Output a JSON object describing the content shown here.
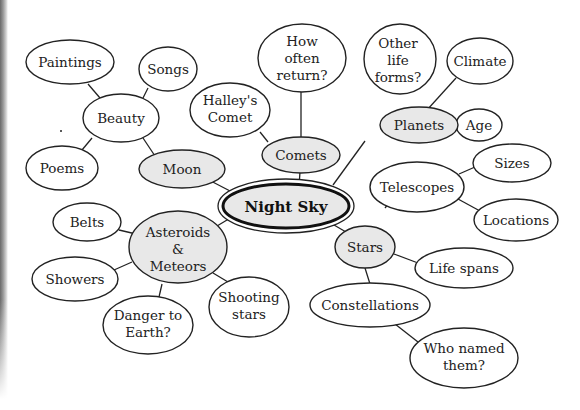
{
  "diagram": {
    "type": "concept-map",
    "colors": {
      "stroke": "#222222",
      "primary_fill": "#e8e8e8",
      "leaf_fill": "#ffffff",
      "background": "#ffffff"
    },
    "center": {
      "id": "night-sky",
      "label": "Night Sky"
    },
    "nodes": [
      {
        "id": "moon",
        "label": "Moon",
        "level": "primary",
        "parent": "night-sky"
      },
      {
        "id": "comets",
        "label": "Comets",
        "level": "primary",
        "parent": "night-sky"
      },
      {
        "id": "planets",
        "label": "Planets",
        "level": "primary",
        "parent": "night-sky"
      },
      {
        "id": "stars",
        "label": "Stars",
        "level": "primary",
        "parent": "night-sky"
      },
      {
        "id": "asteroids",
        "label": "Asteroids & Meteors",
        "lines": [
          "Asteroids",
          "&",
          "Meteors"
        ],
        "level": "primary",
        "parent": "night-sky"
      },
      {
        "id": "beauty",
        "label": "Beauty",
        "level": "secondary",
        "parent": "moon"
      },
      {
        "id": "paintings",
        "label": "Paintings",
        "level": "leaf",
        "parent": "beauty"
      },
      {
        "id": "songs",
        "label": "Songs",
        "level": "leaf",
        "parent": "beauty"
      },
      {
        "id": "poems",
        "label": "Poems",
        "level": "leaf",
        "parent": "beauty"
      },
      {
        "id": "halleys",
        "label": "Halley's Comet",
        "lines": [
          "Halley's",
          "Comet"
        ],
        "level": "leaf",
        "parent": "comets"
      },
      {
        "id": "how-often",
        "label": "How often return?",
        "lines": [
          "How",
          "often",
          "return?"
        ],
        "level": "leaf",
        "parent": "comets"
      },
      {
        "id": "other-life",
        "label": "Other life forms?",
        "lines": [
          "Other",
          "life",
          "forms?"
        ],
        "level": "leaf",
        "parent": "planets"
      },
      {
        "id": "climate",
        "label": "Climate",
        "level": "leaf",
        "parent": "planets"
      },
      {
        "id": "age",
        "label": "Age",
        "level": "leaf",
        "parent": "planets"
      },
      {
        "id": "telescopes",
        "label": "Telescopes",
        "level": "secondary",
        "parent": "stars"
      },
      {
        "id": "sizes",
        "label": "Sizes",
        "level": "leaf",
        "parent": "telescopes"
      },
      {
        "id": "locations",
        "label": "Locations",
        "level": "leaf",
        "parent": "telescopes"
      },
      {
        "id": "life-spans",
        "label": "Life spans",
        "level": "leaf",
        "parent": "stars"
      },
      {
        "id": "constellations",
        "label": "Constellations",
        "level": "secondary",
        "parent": "stars"
      },
      {
        "id": "who-named",
        "label": "Who named them?",
        "lines": [
          "Who named",
          "them?"
        ],
        "level": "leaf",
        "parent": "constellations"
      },
      {
        "id": "belts",
        "label": "Belts",
        "level": "leaf",
        "parent": "asteroids"
      },
      {
        "id": "showers",
        "label": "Showers",
        "level": "leaf",
        "parent": "asteroids"
      },
      {
        "id": "danger",
        "label": "Danger to Earth?",
        "lines": [
          "Danger to",
          "Earth?"
        ],
        "level": "leaf",
        "parent": "asteroids"
      },
      {
        "id": "shooting-stars",
        "label": "Shooting stars",
        "lines": [
          "Shooting",
          "stars"
        ],
        "level": "leaf",
        "parent": "asteroids"
      }
    ],
    "text": {
      "night_sky": "Night Sky",
      "moon": "Moon",
      "comets": "Comets",
      "planets": "Planets",
      "stars": "Stars",
      "asteroids_1": "Asteroids",
      "asteroids_2": "&",
      "asteroids_3": "Meteors",
      "beauty": "Beauty",
      "paintings": "Paintings",
      "songs": "Songs",
      "poems": "Poems",
      "halleys_1": "Halley's",
      "halleys_2": "Comet",
      "how_often_1": "How",
      "how_often_2": "often",
      "how_often_3": "return?",
      "other_life_1": "Other",
      "other_life_2": "life",
      "other_life_3": "forms?",
      "climate": "Climate",
      "age": "Age",
      "telescopes": "Telescopes",
      "sizes": "Sizes",
      "locations": "Locations",
      "life_spans": "Life spans",
      "constellations": "Constellations",
      "who_named_1": "Who named",
      "who_named_2": "them?",
      "belts": "Belts",
      "showers": "Showers",
      "danger_1": "Danger to",
      "danger_2": "Earth?",
      "shooting_1": "Shooting",
      "shooting_2": "stars"
    }
  }
}
